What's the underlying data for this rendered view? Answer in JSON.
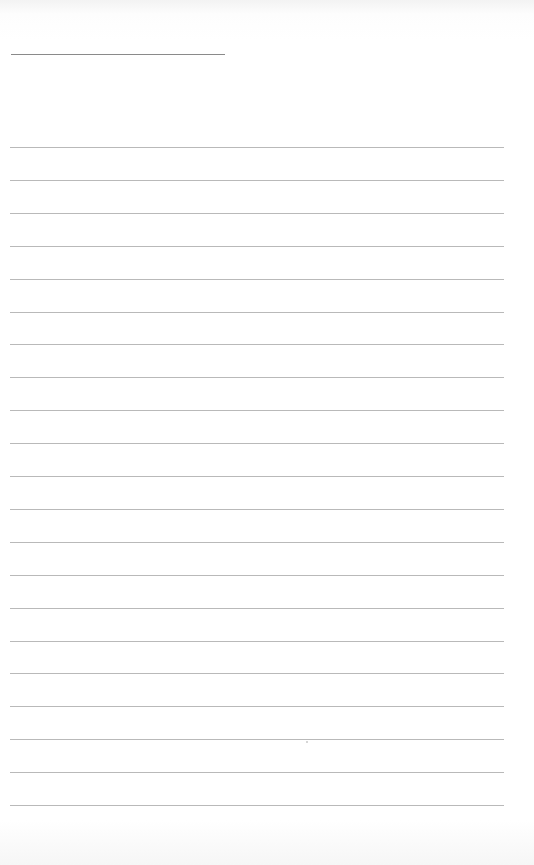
{
  "page": {
    "type": "lined-notepad-page",
    "header_line": true,
    "ruled_line_count": 21,
    "content": []
  }
}
